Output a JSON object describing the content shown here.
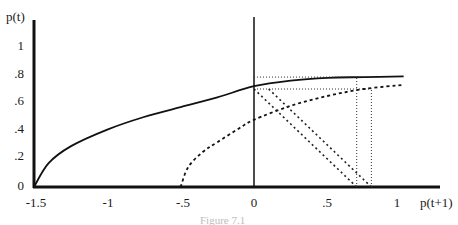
{
  "chart_data": {
    "type": "line",
    "title": "",
    "xlabel": "p(t+1)",
    "ylabel": "p(t)",
    "xlim": [
      -1.5,
      1.1
    ],
    "ylim": [
      0,
      1.1
    ],
    "grid": false,
    "legend": null,
    "x_ticks": [
      "-1.5",
      "-1",
      "-.5",
      "0",
      ".5",
      "1"
    ],
    "x_tick_values": [
      -1.5,
      -1,
      -0.5,
      0,
      0.5,
      1
    ],
    "y_ticks": [
      "0",
      ".2",
      ".4",
      ".6",
      ".8",
      "1"
    ],
    "y_tick_values": [
      0,
      0.2,
      0.4,
      0.6,
      0.8,
      1
    ],
    "series": [
      {
        "name": "solid-curve",
        "style": "solid",
        "x": [
          -1.5,
          -1.4,
          -1.25,
          -1.0,
          -0.75,
          -0.5,
          -0.25,
          0,
          0.25,
          0.5,
          0.75,
          1.02
        ],
        "y": [
          0,
          0.17,
          0.29,
          0.41,
          0.5,
          0.57,
          0.64,
          0.72,
          0.76,
          0.78,
          0.785,
          0.79
        ]
      },
      {
        "name": "dashed-curve",
        "style": "dashed",
        "x": [
          -0.5,
          -0.45,
          -0.35,
          -0.25,
          -0.1,
          0,
          0.25,
          0.5,
          0.75,
          1.02
        ],
        "y": [
          0,
          0.14,
          0.25,
          0.32,
          0.42,
          0.48,
          0.58,
          0.65,
          0.7,
          0.73
        ]
      }
    ],
    "annotations": {
      "dotted_horizontals": [
        {
          "y": 0.785,
          "x_from": 0,
          "x_to": 0.7
        },
        {
          "y": 0.7,
          "x_from": 0,
          "x_to": 0.8
        }
      ],
      "dotted_verticals": [
        {
          "x": 0.7,
          "y_from": 0,
          "y_to": 0.785
        },
        {
          "x": 0.8,
          "y_from": 0,
          "y_to": 0.7
        }
      ],
      "dotted_diagonals": [
        {
          "from": [
            0,
            0.7
          ],
          "to": [
            0.7,
            0
          ]
        },
        {
          "from": [
            0.1,
            0.7
          ],
          "to": [
            0.8,
            0
          ]
        }
      ]
    }
  },
  "labels": {
    "y_axis": "p(t)",
    "x_axis": "p(t+1)",
    "caption": "Figure 7.1"
  }
}
